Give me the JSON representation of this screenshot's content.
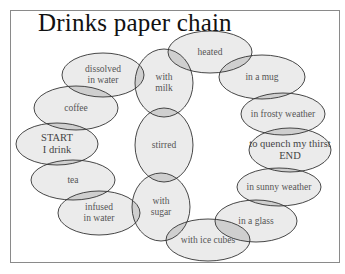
{
  "title": "Drinks paper chain",
  "colors": {
    "ellipse_fill": "#ebebeb",
    "overlap_fill": "#cfcfcf",
    "stroke": "#333333",
    "frame": "#8a8a8a"
  },
  "nodes": [
    {
      "id": "start",
      "label": "START\nI drink",
      "cx": 57,
      "cy": 144,
      "rx": 41,
      "ry": 21
    },
    {
      "id": "coffee",
      "label": "coffee",
      "cx": 76,
      "cy": 108,
      "rx": 42,
      "ry": 22
    },
    {
      "id": "dissolved",
      "label": "dissolved\nin water",
      "cx": 103,
      "cy": 75,
      "rx": 41,
      "ry": 22
    },
    {
      "id": "with-milk",
      "label": "with\nmilk",
      "cx": 164,
      "cy": 83,
      "rx": 29,
      "ry": 34
    },
    {
      "id": "heated",
      "label": "heated",
      "cx": 210,
      "cy": 52,
      "rx": 42,
      "ry": 21
    },
    {
      "id": "in-a-mug",
      "label": "in a mug",
      "cx": 262,
      "cy": 77,
      "rx": 43,
      "ry": 22
    },
    {
      "id": "in-frosty-weather",
      "label": "in frosty weather",
      "cx": 283,
      "cy": 114,
      "rx": 42,
      "ry": 21
    },
    {
      "id": "to-quench",
      "label": "to quench my thirst\nEND",
      "cx": 290,
      "cy": 150,
      "rx": 41,
      "ry": 22
    },
    {
      "id": "in-sunny-weather",
      "label": "in sunny weather",
      "cx": 279,
      "cy": 187,
      "rx": 42,
      "ry": 19
    },
    {
      "id": "in-a-glass",
      "label": "in a glass",
      "cx": 256,
      "cy": 221,
      "rx": 41,
      "ry": 21
    },
    {
      "id": "with-ice-cubes",
      "label": "with ice cubes",
      "cx": 208,
      "cy": 240,
      "rx": 42,
      "ry": 21
    },
    {
      "id": "with-sugar",
      "label": "with\nsugar",
      "cx": 161,
      "cy": 207,
      "rx": 29,
      "ry": 34
    },
    {
      "id": "infused",
      "label": "infused\nin water",
      "cx": 99,
      "cy": 213,
      "rx": 41,
      "ry": 22
    },
    {
      "id": "tea",
      "label": "tea",
      "cx": 73,
      "cy": 180,
      "rx": 42,
      "ry": 20
    },
    {
      "id": "stirred",
      "label": "stirred",
      "cx": 164,
      "cy": 145,
      "rx": 29,
      "ry": 37
    }
  ],
  "links": [
    [
      "start",
      "coffee"
    ],
    [
      "coffee",
      "dissolved"
    ],
    [
      "dissolved",
      "with-milk"
    ],
    [
      "with-milk",
      "heated"
    ],
    [
      "heated",
      "in-a-mug"
    ],
    [
      "in-a-mug",
      "in-frosty-weather"
    ],
    [
      "in-frosty-weather",
      "to-quench"
    ],
    [
      "to-quench",
      "in-sunny-weather"
    ],
    [
      "in-sunny-weather",
      "in-a-glass"
    ],
    [
      "in-a-glass",
      "with-ice-cubes"
    ],
    [
      "with-ice-cubes",
      "with-sugar"
    ],
    [
      "with-sugar",
      "infused"
    ],
    [
      "infused",
      "tea"
    ],
    [
      "tea",
      "start"
    ],
    [
      "with-milk",
      "stirred"
    ],
    [
      "stirred",
      "with-sugar"
    ]
  ]
}
